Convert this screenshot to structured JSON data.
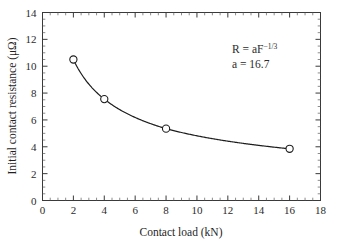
{
  "chart_data": {
    "type": "line",
    "title": "",
    "xlabel": "Contact load (kN)",
    "ylabel": "Initial contact resistance (μΩ)",
    "xlim": [
      0,
      18
    ],
    "ylim": [
      0,
      14
    ],
    "x_major_step": 2,
    "x_minor_step": 0.5,
    "y_major_step": 2,
    "y_minor_step": 0.5,
    "grid": false,
    "legend": "none",
    "marker": "open-circle",
    "x": [
      2,
      4,
      8,
      16
    ],
    "values": [
      10.5,
      7.55,
      5.35,
      3.85
    ],
    "series": [
      {
        "name": "Initial contact resistance",
        "x": [
          2,
          4,
          8,
          16
        ],
        "values": [
          10.5,
          7.55,
          5.35,
          3.85
        ]
      }
    ],
    "xticks": [
      0,
      2,
      4,
      6,
      8,
      10,
      12,
      14,
      16,
      18
    ],
    "xticklabels": [
      "0",
      "2",
      "4",
      "6",
      "8",
      "10",
      "12",
      "14",
      "16",
      "18"
    ],
    "yticks": [
      0,
      2,
      4,
      6,
      8,
      10,
      12,
      14
    ],
    "yticklabels": [
      "0",
      "2",
      "4",
      "6",
      "8",
      "10",
      "12",
      "14"
    ],
    "annotations": [
      {
        "id": "fit-equation",
        "base": "R = aF",
        "exponent": "−1/3",
        "x": 13.2,
        "y": 12.1
      },
      {
        "id": "fit-coefficient",
        "text": "a = 16.7",
        "x": 13.2,
        "y": 11.1
      }
    ],
    "fit": {
      "model": "R = a*F^(-1/3)",
      "a": 16.7
    },
    "colors": {
      "curve": "#1c1c1c",
      "marker_edge": "#1c1c1c",
      "marker_face": "#ffffff",
      "axis": "#3a3a3a",
      "background": "#ffffff",
      "text": "#2b2b2b"
    }
  }
}
